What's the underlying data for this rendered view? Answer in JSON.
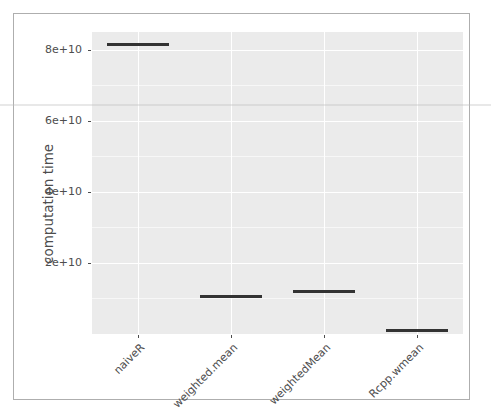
{
  "chart_data": {
    "type": "bar",
    "title": "",
    "subtitle": "",
    "xlabel": "",
    "ylabel": "computation time",
    "categories": [
      "naiveR",
      "weighted.mean",
      "weightedMean",
      "Rcpp.wmean"
    ],
    "values": [
      82000000000,
      11000000000,
      12500000000,
      1500000000
    ],
    "ytick_labels": [
      "8e+10",
      "6e+10",
      "4e+10",
      "2e+10"
    ],
    "ytick_values": [
      80000000000,
      60000000000,
      40000000000,
      20000000000
    ],
    "ylim": [
      0,
      85000000000
    ],
    "grid": "major-white-on-grey",
    "legend": "none",
    "mark_style": "horizontal-crossbar",
    "series_color": "#333333",
    "panel_background": "#ebebeb",
    "gridline_color": "#ffffff",
    "axis_text_color": "#4d4d4d",
    "x_tick_label_rotation_deg": 45
  },
  "axes": {
    "y": {
      "title": "computation time",
      "ticks": [
        {
          "label": "8e+10",
          "value": 80000000000
        },
        {
          "label": "6e+10",
          "value": 60000000000
        },
        {
          "label": "4e+10",
          "value": 40000000000
        },
        {
          "label": "2e+10",
          "value": 20000000000
        }
      ]
    },
    "x": {
      "title": "",
      "ticks": [
        {
          "label": "naiveR"
        },
        {
          "label": "weighted.mean"
        },
        {
          "label": "weightedMean"
        },
        {
          "label": "Rcpp.wmean"
        }
      ]
    }
  }
}
